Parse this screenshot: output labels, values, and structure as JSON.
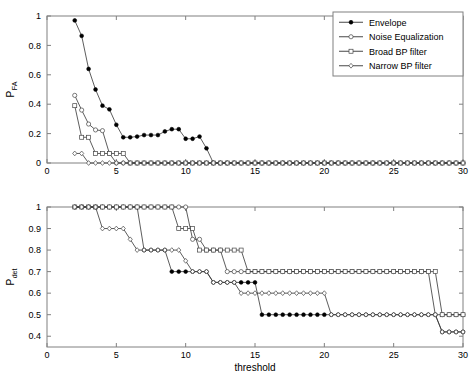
{
  "figure": {
    "background": "#ffffff",
    "line_color": "#333333",
    "axis_color": "#808080"
  },
  "legend": {
    "position": "top-right",
    "entries": [
      {
        "label": "Envelope",
        "marker": "filled-circle"
      },
      {
        "label": "Noise Equalization",
        "marker": "open-circle"
      },
      {
        "label": "Broad BP filter",
        "marker": "open-square"
      },
      {
        "label": "Narrow BP filter",
        "marker": "open-diamond"
      }
    ]
  },
  "chart_data": [
    {
      "type": "line",
      "id": "pfa-plot",
      "title": "",
      "xlabel": "",
      "ylabel": "P_FA",
      "ylabel_base": "P",
      "ylabel_sub": "FA",
      "xlim": [
        0,
        30
      ],
      "ylim": [
        0,
        1
      ],
      "xticks": [
        0,
        5,
        10,
        15,
        20,
        25,
        30
      ],
      "yticks": [
        0,
        0.2,
        0.4,
        0.6,
        0.8,
        1
      ],
      "ytick_labels": [
        "0",
        "0.2",
        "0.4",
        "0.6",
        "0.8",
        "1"
      ],
      "xtick_labels": [
        "0",
        "5",
        "10",
        "15",
        "20",
        "25",
        "30"
      ],
      "grid": false,
      "legend": true,
      "series": [
        {
          "name": "Envelope",
          "marker": "filled-circle",
          "x": [
            2,
            2.5,
            3,
            3.5,
            4,
            4.5,
            5,
            5.5,
            6,
            6.5,
            7,
            7.5,
            8,
            8.5,
            9,
            9.5,
            10,
            10.5,
            11,
            11.5,
            12,
            12.5,
            13,
            13.5,
            14,
            14.5,
            15,
            15.5,
            16,
            16.5,
            17,
            17.5,
            18,
            18.5,
            19,
            19.5,
            20,
            20.5,
            21,
            21.5,
            22,
            22.5,
            23,
            23.5,
            24,
            24.5,
            25,
            25.5,
            26,
            26.5,
            27,
            27.5,
            28,
            28.5,
            29,
            29.5,
            30
          ],
          "y": [
            0.97,
            0.865,
            0.64,
            0.5,
            0.39,
            0.365,
            0.26,
            0.175,
            0.175,
            0.18,
            0.19,
            0.19,
            0.19,
            0.215,
            0.23,
            0.23,
            0.165,
            0.165,
            0.18,
            0.1,
            0,
            0,
            0,
            0,
            0,
            0,
            0,
            0,
            0,
            0,
            0,
            0,
            0,
            0,
            0,
            0,
            0,
            0,
            0,
            0,
            0,
            0,
            0,
            0,
            0,
            0,
            0,
            0,
            0,
            0,
            0,
            0,
            0,
            0,
            0,
            0,
            0
          ]
        },
        {
          "name": "Noise Equalization",
          "marker": "open-circle",
          "x": [
            2,
            2.5,
            3,
            3.5,
            4,
            4.5,
            5,
            5.5,
            6,
            6.5,
            7,
            7.5,
            8,
            8.5,
            9,
            9.5,
            10,
            10.5,
            11,
            11.5,
            12,
            12.5,
            13,
            13.5,
            14,
            14.5,
            15,
            15.5,
            16,
            16.5,
            17,
            17.5,
            18,
            18.5,
            19,
            19.5,
            20,
            20.5,
            21,
            21.5,
            22,
            22.5,
            23,
            23.5,
            24,
            24.5,
            25,
            25.5,
            26,
            26.5,
            27,
            27.5,
            28,
            28.5,
            29,
            29.5,
            30
          ],
          "y": [
            0.46,
            0.36,
            0.265,
            0.225,
            0.22,
            0.065,
            0,
            0,
            0,
            0,
            0,
            0,
            0,
            0,
            0,
            0,
            0,
            0,
            0,
            0,
            0,
            0,
            0,
            0,
            0,
            0,
            0,
            0,
            0,
            0,
            0,
            0,
            0,
            0,
            0,
            0,
            0,
            0,
            0,
            0,
            0,
            0,
            0,
            0,
            0,
            0,
            0,
            0,
            0,
            0,
            0,
            0,
            0,
            0,
            0,
            0,
            0
          ]
        },
        {
          "name": "Broad BP filter",
          "marker": "open-square",
          "x": [
            2,
            2.5,
            3,
            3.5,
            4,
            4.5,
            5,
            5.5,
            6,
            6.5,
            7,
            7.5,
            8,
            8.5,
            9,
            9.5,
            10,
            10.5,
            11,
            11.5,
            12,
            12.5,
            13,
            13.5,
            14,
            14.5,
            15,
            15.5,
            16,
            16.5,
            17,
            17.5,
            18,
            18.5,
            19,
            19.5,
            20,
            20.5,
            21,
            21.5,
            22,
            22.5,
            23,
            23.5,
            24,
            24.5,
            25,
            25.5,
            26,
            26.5,
            27,
            27.5,
            28,
            28.5,
            29,
            29.5,
            30
          ],
          "y": [
            0.39,
            0.175,
            0.175,
            0.065,
            0.065,
            0.065,
            0.065,
            0.065,
            0,
            0,
            0,
            0,
            0,
            0,
            0,
            0,
            0,
            0,
            0,
            0,
            0,
            0,
            0,
            0,
            0,
            0,
            0,
            0,
            0,
            0,
            0,
            0,
            0,
            0,
            0,
            0,
            0,
            0,
            0,
            0,
            0,
            0,
            0,
            0,
            0,
            0,
            0,
            0,
            0,
            0,
            0,
            0,
            0,
            0,
            0,
            0,
            0
          ]
        },
        {
          "name": "Narrow BP filter",
          "marker": "open-diamond",
          "x": [
            2,
            2.5,
            3,
            3.5,
            4,
            4.5,
            5,
            5.5,
            6,
            6.5,
            7,
            7.5,
            8,
            8.5,
            9,
            9.5,
            10,
            10.5,
            11,
            11.5,
            12,
            12.5,
            13,
            13.5,
            14,
            14.5,
            15,
            15.5,
            16,
            16.5,
            17,
            17.5,
            18,
            18.5,
            19,
            19.5,
            20,
            20.5,
            21,
            21.5,
            22,
            22.5,
            23,
            23.5,
            24,
            24.5,
            25,
            25.5,
            26,
            26.5,
            27,
            27.5,
            28,
            28.5,
            29,
            29.5,
            30
          ],
          "y": [
            0.065,
            0.065,
            0,
            0,
            0,
            0,
            0,
            0,
            0,
            0,
            0,
            0,
            0,
            0,
            0,
            0,
            0,
            0,
            0,
            0,
            0,
            0,
            0,
            0,
            0,
            0,
            0,
            0,
            0,
            0,
            0,
            0,
            0,
            0,
            0,
            0,
            0,
            0,
            0,
            0,
            0,
            0,
            0,
            0,
            0,
            0,
            0,
            0,
            0,
            0,
            0,
            0,
            0,
            0,
            0,
            0,
            0
          ]
        }
      ]
    },
    {
      "type": "line",
      "id": "pdet-plot",
      "title": "",
      "xlabel": "threshold",
      "ylabel": "P_det",
      "ylabel_base": "P",
      "ylabel_sub": "det",
      "xlim": [
        0,
        30
      ],
      "ylim": [
        0.35,
        1
      ],
      "xticks": [
        0,
        5,
        10,
        15,
        20,
        25,
        30
      ],
      "yticks": [
        0.4,
        0.5,
        0.6,
        0.7,
        0.8,
        0.9,
        1
      ],
      "ytick_labels": [
        "0.4",
        "0.5",
        "0.6",
        "0.7",
        "0.8",
        "0.9",
        "1"
      ],
      "xtick_labels": [
        "0",
        "5",
        "10",
        "15",
        "20",
        "25",
        "30"
      ],
      "grid": false,
      "legend": false,
      "series": [
        {
          "name": "Envelope",
          "marker": "filled-circle",
          "x": [
            2,
            2.5,
            3,
            3.5,
            4,
            4.5,
            5,
            5.5,
            6,
            6.5,
            7,
            7.5,
            8,
            8.5,
            9,
            9.5,
            10,
            10.5,
            11,
            11.5,
            12,
            12.5,
            13,
            13.5,
            14,
            14.5,
            15,
            15.5,
            16,
            16.5,
            17,
            17.5,
            18,
            18.5,
            19,
            19.5,
            20,
            20.5,
            21,
            21.5,
            22,
            22.5,
            23,
            23.5,
            24,
            24.5,
            25,
            25.5,
            26,
            26.5,
            27,
            27.5,
            28,
            28.5,
            29,
            29.5,
            30
          ],
          "y": [
            1,
            1,
            1,
            1,
            1,
            1,
            1,
            1,
            1,
            1,
            0.8,
            0.8,
            0.8,
            0.8,
            0.7,
            0.7,
            0.7,
            0.7,
            0.7,
            0.7,
            0.65,
            0.65,
            0.65,
            0.65,
            0.65,
            0.65,
            0.65,
            0.5,
            0.5,
            0.5,
            0.5,
            0.5,
            0.5,
            0.5,
            0.5,
            0.5,
            0.5,
            0.5,
            0.5,
            0.5,
            0.5,
            0.5,
            0.5,
            0.5,
            0.5,
            0.5,
            0.5,
            0.5,
            0.5,
            0.5,
            0.5,
            0.5,
            0.5,
            0.42,
            0.42,
            0.42,
            0.42
          ]
        },
        {
          "name": "Noise Equalization",
          "marker": "open-circle",
          "x": [
            2,
            2.5,
            3,
            3.5,
            4,
            4.5,
            5,
            5.5,
            6,
            6.5,
            7,
            7.5,
            8,
            8.5,
            9,
            9.5,
            10,
            10.5,
            11,
            11.5,
            12,
            12.5,
            13,
            13.5,
            14,
            14.5,
            15,
            15.5,
            16,
            16.5,
            17,
            17.5,
            18,
            18.5,
            19,
            19.5,
            20,
            20.5,
            21,
            21.5,
            22,
            22.5,
            23,
            23.5,
            24,
            24.5,
            25,
            25.5,
            26,
            26.5,
            27,
            27.5,
            28,
            28.5,
            29,
            29.5,
            30
          ],
          "y": [
            1,
            1,
            1,
            1,
            1,
            1,
            1,
            1,
            1,
            1,
            1,
            1,
            1,
            1,
            1,
            1,
            1,
            0.85,
            0.85,
            0.8,
            0.8,
            0.8,
            0.7,
            0.7,
            0.7,
            0.7,
            0.7,
            0.7,
            0.7,
            0.7,
            0.7,
            0.7,
            0.7,
            0.7,
            0.7,
            0.7,
            0.7,
            0.7,
            0.7,
            0.7,
            0.7,
            0.7,
            0.7,
            0.7,
            0.7,
            0.7,
            0.7,
            0.7,
            0.7,
            0.7,
            0.7,
            0.7,
            0.5,
            0.5,
            0.5,
            0.5,
            0.5
          ]
        },
        {
          "name": "Broad BP filter",
          "marker": "open-square",
          "x": [
            2,
            2.5,
            3,
            3.5,
            4,
            4.5,
            5,
            5.5,
            6,
            6.5,
            7,
            7.5,
            8,
            8.5,
            9,
            9.5,
            10,
            10.5,
            11,
            11.5,
            12,
            12.5,
            13,
            13.5,
            14,
            14.5,
            15,
            15.5,
            16,
            16.5,
            17,
            17.5,
            18,
            18.5,
            19,
            19.5,
            20,
            20.5,
            21,
            21.5,
            22,
            22.5,
            23,
            23.5,
            24,
            24.5,
            25,
            25.5,
            26,
            26.5,
            27,
            27.5,
            28,
            28.5,
            29,
            29.5,
            30
          ],
          "y": [
            1,
            1,
            1,
            1,
            1,
            1,
            1,
            1,
            1,
            1,
            1,
            1,
            1,
            1,
            1,
            0.9,
            0.9,
            0.9,
            0.8,
            0.8,
            0.8,
            0.8,
            0.8,
            0.8,
            0.8,
            0.7,
            0.7,
            0.7,
            0.7,
            0.7,
            0.7,
            0.7,
            0.7,
            0.7,
            0.7,
            0.7,
            0.7,
            0.7,
            0.7,
            0.7,
            0.7,
            0.7,
            0.7,
            0.7,
            0.7,
            0.7,
            0.7,
            0.7,
            0.7,
            0.7,
            0.7,
            0.7,
            0.7,
            0.5,
            0.5,
            0.5,
            0.5
          ]
        },
        {
          "name": "Narrow BP filter",
          "marker": "open-diamond",
          "x": [
            2,
            2.5,
            3,
            3.5,
            4,
            4.5,
            5,
            5.5,
            6,
            6.5,
            7,
            7.5,
            8,
            8.5,
            9,
            9.5,
            10,
            10.5,
            11,
            11.5,
            12,
            12.5,
            13,
            13.5,
            14,
            14.5,
            15,
            15.5,
            16,
            16.5,
            17,
            17.5,
            18,
            18.5,
            19,
            19.5,
            20,
            20.5,
            21,
            21.5,
            22,
            22.5,
            23,
            23.5,
            24,
            24.5,
            25,
            25.5,
            26,
            26.5,
            27,
            27.5,
            28,
            28.5,
            29,
            29.5,
            30
          ],
          "y": [
            1,
            1,
            1,
            1,
            0.9,
            0.9,
            0.9,
            0.9,
            0.85,
            0.8,
            0.8,
            0.8,
            0.8,
            0.8,
            0.8,
            0.8,
            0.75,
            0.7,
            0.7,
            0.7,
            0.65,
            0.65,
            0.65,
            0.65,
            0.6,
            0.6,
            0.6,
            0.6,
            0.6,
            0.6,
            0.6,
            0.6,
            0.6,
            0.6,
            0.6,
            0.6,
            0.6,
            0.5,
            0.5,
            0.5,
            0.5,
            0.5,
            0.5,
            0.5,
            0.5,
            0.5,
            0.5,
            0.5,
            0.5,
            0.5,
            0.5,
            0.5,
            0.5,
            0.42,
            0.42,
            0.42,
            0.42
          ]
        }
      ]
    }
  ]
}
